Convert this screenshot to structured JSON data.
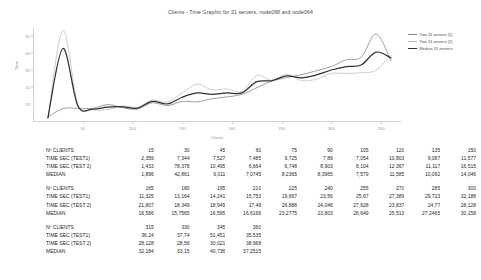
{
  "chart_data": {
    "type": "line",
    "title": "Clients - Time Graphic for 31 servers, node068 and node064",
    "xlabel": "Clients",
    "ylabel": "Time",
    "xlim": [
      0,
      370
    ],
    "ylim": [
      0,
      55
    ],
    "grid": false,
    "legend_position": "right",
    "xticks": [
      "50",
      "100",
      "150",
      "200",
      "250",
      "300",
      "350"
    ],
    "yticks": [
      "10",
      "20",
      "30",
      "40",
      "50"
    ],
    "x": [
      15,
      30,
      45,
      60,
      75,
      90,
      105,
      120,
      135,
      150,
      165,
      180,
      195,
      210,
      225,
      240,
      255,
      270,
      285,
      300,
      315,
      330,
      345,
      360
    ],
    "series": [
      {
        "name": "Two 31 servers (1)",
        "color": "#7b7f86",
        "values": [
          2.359,
          7.344,
          7.527,
          7.485,
          9.725,
          7.89,
          7.054,
          10.803,
          9.087,
          11.577,
          11.325,
          13.164,
          14.241,
          15.753,
          19.667,
          23.56,
          25.67,
          27.389,
          29.723,
          32.188,
          36.24,
          37.74,
          51.451,
          35.535
        ]
      },
      {
        "name": "Two 31 servers (2)",
        "color": "#b9bcc2",
        "values": [
          1.433,
          78.378,
          10.495,
          6.664,
          6.748,
          8.903,
          8.104,
          12.367,
          11.117,
          16.515,
          21.807,
          18.349,
          18.949,
          17.48,
          26.888,
          24.046,
          27.628,
          23.837,
          24.77,
          28.128,
          28.128,
          28.56,
          30.021,
          38.968
        ]
      },
      {
        "name": "Median 31 servers",
        "color": "#2f3033",
        "values": [
          1.896,
          42.861,
          9.011,
          7.0745,
          8.2365,
          8.3965,
          7.579,
          11.585,
          10.092,
          14.046,
          16.566,
          15.7565,
          16.595,
          16.6166,
          23.2775,
          23.803,
          26.649,
          25.513,
          27.2465,
          30.158,
          32.184,
          33.15,
          40.736,
          37.2515
        ]
      }
    ]
  },
  "tables": [
    {
      "rows": [
        {
          "label": "Nº CLIENTS",
          "values": [
            "15",
            "30",
            "45",
            "60",
            "75",
            "90",
            "105",
            "120",
            "135",
            "150"
          ]
        },
        {
          "label": "TIME SEC (TEST1)",
          "values": [
            "2,359",
            "7,344",
            "7,527",
            "7,485",
            "9,725",
            "7,89",
            "7,054",
            "10,803",
            "9,087",
            "11,577"
          ]
        },
        {
          "label": "TIME SEC (TEST 2)",
          "values": [
            "1,433",
            "78,378",
            "10,495",
            "6,664",
            "6,748",
            "8,903",
            "8,104",
            "12,367",
            "11,117",
            "16,515"
          ]
        },
        {
          "label": "MEDIAN",
          "values": [
            "1,896",
            "42,861",
            "9,011",
            "7,0745",
            "8,2365",
            "8,3965",
            "7,579",
            "11,585",
            "10,092",
            "14,046"
          ]
        }
      ]
    },
    {
      "rows": [
        {
          "label": "Nº CLIENTS",
          "values": [
            "165",
            "180",
            "195",
            "210",
            "225",
            "240",
            "255",
            "270",
            "285",
            "300"
          ]
        },
        {
          "label": "TIME SEC (TEST1)",
          "values": [
            "11,325",
            "13,164",
            "14,241",
            "15,753",
            "19,667",
            "23,56",
            "25,67",
            "27,389",
            "29,723",
            "32,188"
          ]
        },
        {
          "label": "TIME SEC (TEST 2)",
          "values": [
            "21,807",
            "18,349",
            "18,949",
            "17,48",
            "26,888",
            "24,046",
            "27,628",
            "23,837",
            "24,77",
            "28,128"
          ]
        },
        {
          "label": "MEDIAN",
          "values": [
            "16,566",
            "15,7565",
            "16,595",
            "16,6166",
            "23,2775",
            "23,803",
            "26,649",
            "25,513",
            "27,2465",
            "30,158"
          ]
        }
      ]
    },
    {
      "rows": [
        {
          "label": "Nº CLIENTS",
          "values": [
            "315",
            "330",
            "345",
            "360",
            "",
            "",
            "",
            "",
            "",
            ""
          ]
        },
        {
          "label": "TIME SEC (TEST1)",
          "values": [
            "36,24",
            "37,74",
            "51,451",
            "35,535",
            "",
            "",
            "",
            "",
            "",
            ""
          ]
        },
        {
          "label": "TIME SEC (TEST 2)",
          "values": [
            "28,128",
            "28,56",
            "30,021",
            "38,968",
            "",
            "",
            "",
            "",
            "",
            ""
          ]
        },
        {
          "label": "MEDIAN",
          "values": [
            "32,184",
            "33,15",
            "40,736",
            "37,2515",
            "",
            "",
            "",
            "",
            "",
            ""
          ]
        }
      ]
    }
  ]
}
